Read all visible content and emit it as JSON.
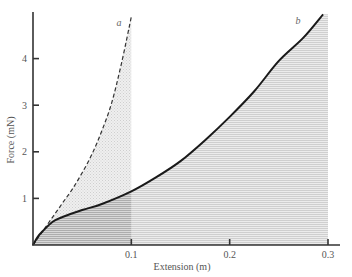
{
  "chart_data": {
    "type": "area",
    "title": "",
    "xlabel": "Extension (m)",
    "ylabel": "Force (mN)",
    "xlim": [
      0,
      0.3
    ],
    "ylim": [
      0,
      5
    ],
    "x_ticks": [
      {
        "value": 0.1,
        "label": "0.1"
      },
      {
        "value": 0.2,
        "label": "0.2"
      },
      {
        "value": 0.3,
        "label": "0.3"
      }
    ],
    "y_ticks": [
      {
        "value": 1,
        "label": "1"
      },
      {
        "value": 2,
        "label": "2"
      },
      {
        "value": 3,
        "label": "3"
      },
      {
        "value": 4,
        "label": "4"
      }
    ],
    "grid": false,
    "legend": "none",
    "series": [
      {
        "name": "a",
        "style": "dashed",
        "shaded": true,
        "shade_to_x": 0.1,
        "points": [
          [
            0,
            0
          ],
          [
            0.01,
            0.3
          ],
          [
            0.02,
            0.6
          ],
          [
            0.03,
            0.9
          ],
          [
            0.04,
            1.2
          ],
          [
            0.05,
            1.55
          ],
          [
            0.06,
            1.95
          ],
          [
            0.07,
            2.45
          ],
          [
            0.08,
            3.05
          ],
          [
            0.09,
            3.9
          ],
          [
            0.1,
            4.9
          ]
        ]
      },
      {
        "name": "b",
        "style": "solid",
        "shaded": true,
        "shade_to_x": 0.3,
        "points": [
          [
            0,
            0
          ],
          [
            0.005,
            0.18
          ],
          [
            0.01,
            0.3
          ],
          [
            0.02,
            0.5
          ],
          [
            0.03,
            0.6
          ],
          [
            0.05,
            0.75
          ],
          [
            0.07,
            0.88
          ],
          [
            0.1,
            1.15
          ],
          [
            0.125,
            1.45
          ],
          [
            0.15,
            1.8
          ],
          [
            0.175,
            2.25
          ],
          [
            0.2,
            2.75
          ],
          [
            0.225,
            3.3
          ],
          [
            0.25,
            3.95
          ],
          [
            0.275,
            4.45
          ],
          [
            0.295,
            4.95
          ]
        ]
      }
    ],
    "annotations": [
      {
        "text": "a",
        "x": 0.085,
        "y": 4.7
      },
      {
        "text": "b",
        "x": 0.267,
        "y": 4.75
      }
    ]
  }
}
